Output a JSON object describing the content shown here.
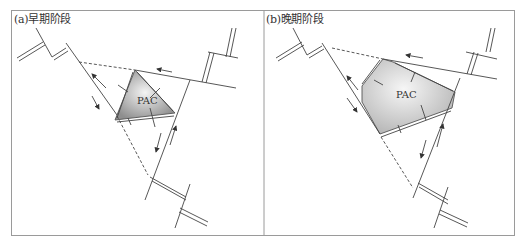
{
  "figure": {
    "panels": [
      {
        "id": "a",
        "label": "(a)早期阶段",
        "plate_label": "PAC"
      },
      {
        "id": "b",
        "label": "(b)晚期阶段",
        "plate_label": "PAC"
      }
    ]
  },
  "colors": {
    "line": "#444444",
    "frame": "#9a9a9a",
    "plate_fill_light": "#f2f2f2",
    "plate_fill_dark": "#9c9c9c"
  }
}
